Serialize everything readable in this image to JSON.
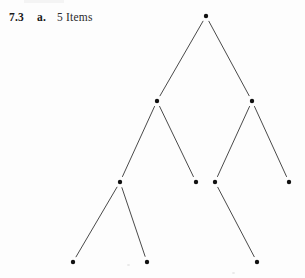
{
  "figure": {
    "caption": {
      "number": "7.3",
      "part": "a.",
      "label": "5 Items"
    },
    "background_color": "#fdfdfd",
    "node_color": "#111111",
    "edge_color": "#4a4a4a"
  },
  "chart_data": {
    "type": "diagram",
    "diagram_type": "binary-tree",
    "node_radius": 2.2,
    "edge_gap": 6,
    "nodes": [
      {
        "id": "root",
        "x": 206,
        "y": 16,
        "level": 0
      },
      {
        "id": "n-l",
        "x": 157,
        "y": 101,
        "level": 1
      },
      {
        "id": "n-r",
        "x": 252,
        "y": 101,
        "level": 1
      },
      {
        "id": "n-ll",
        "x": 120,
        "y": 182,
        "level": 2
      },
      {
        "id": "n-lr",
        "x": 196,
        "y": 182,
        "level": 2
      },
      {
        "id": "n-rl",
        "x": 215,
        "y": 182,
        "level": 2
      },
      {
        "id": "n-rr",
        "x": 289,
        "y": 182,
        "level": 2
      },
      {
        "id": "n-lll",
        "x": 73,
        "y": 262,
        "level": 3
      },
      {
        "id": "n-llr",
        "x": 147,
        "y": 262,
        "level": 3
      },
      {
        "id": "n-rlr",
        "x": 257,
        "y": 262,
        "level": 3
      }
    ],
    "edges": [
      {
        "from": "root",
        "to": "n-l"
      },
      {
        "from": "root",
        "to": "n-r"
      },
      {
        "from": "n-l",
        "to": "n-ll"
      },
      {
        "from": "n-l",
        "to": "n-lr"
      },
      {
        "from": "n-r",
        "to": "n-rl"
      },
      {
        "from": "n-r",
        "to": "n-rr"
      },
      {
        "from": "n-ll",
        "to": "n-lll"
      },
      {
        "from": "n-ll",
        "to": "n-llr"
      },
      {
        "from": "n-rl",
        "to": "n-rlr"
      }
    ],
    "node_count": 10,
    "edge_count": 9,
    "depth": 4
  }
}
